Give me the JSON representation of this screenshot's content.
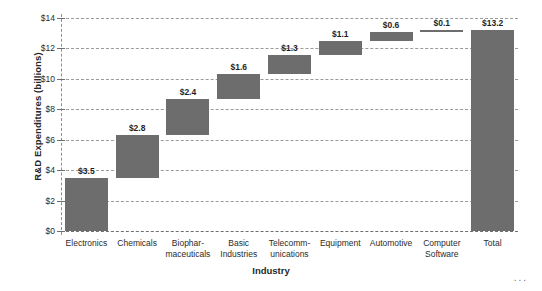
{
  "chart_data": {
    "type": "bar",
    "chart_style": "waterfall",
    "title": "",
    "xlabel": "Industry",
    "ylabel": "R&D Expenditures (billions)",
    "ylim": [
      0,
      14
    ],
    "y_tick_step": 2,
    "y_ticks": [
      "$0",
      "$2",
      "$4",
      "$6",
      "$8",
      "$10",
      "$12",
      "$14"
    ],
    "y_tick_values": [
      0,
      2,
      4,
      6,
      8,
      10,
      12,
      14
    ],
    "grid": true,
    "grid_style": "dashed-horizontal",
    "legend": "none",
    "categories": [
      "Electronics",
      "Chemicals",
      "Biophar-\nmaceuticals",
      "Basic\nIndustries",
      "Telecomm-\nunications",
      "Equipment",
      "Automotive",
      "Computer\nSoftware",
      "Total"
    ],
    "values": [
      3.5,
      2.8,
      2.4,
      1.6,
      1.3,
      1.1,
      0.6,
      0.1,
      13.2
    ],
    "data_labels": [
      "$3.5",
      "$2.8",
      "$2.4",
      "$1.6",
      "$1.3",
      "$1.1",
      "$0.6",
      "$0.1",
      "$13.2"
    ],
    "bar_bases": [
      0,
      3.5,
      6.3,
      8.7,
      10.3,
      11.6,
      12.5,
      13.1,
      0
    ],
    "bar_tops": [
      3.5,
      6.3,
      8.7,
      10.3,
      11.6,
      12.5,
      13.1,
      13.2,
      13.2
    ],
    "series": [
      {
        "name": "R&D Expenditures",
        "values": [
          3.5,
          2.8,
          2.4,
          1.6,
          1.3,
          1.1,
          0.6,
          0.1,
          13.2
        ]
      }
    ],
    "bar_color": "#6d6d6d",
    "grid_color": "#9a9a9a",
    "annotations": [
      "..."
    ]
  },
  "footer": {
    "ellipsis": "..."
  }
}
